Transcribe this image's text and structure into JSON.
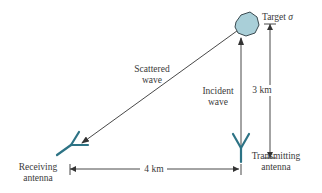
{
  "diagram": {
    "colors": {
      "line": "#333333",
      "antenna": "#2d7385",
      "target_fill": "#a9cfd8",
      "target_stroke": "#3a4a50",
      "text": "#3a3a3a"
    },
    "target": {
      "label": "Target",
      "symbol": "σ"
    },
    "scattered_wave": {
      "line1": "Scattered",
      "line2": "wave"
    },
    "incident_wave": {
      "line1": "Incident",
      "line2": "wave"
    },
    "vertical_distance": "3 km",
    "horizontal_distance": "4 km",
    "receiving_antenna": {
      "line1": "Receiving",
      "line2": "antenna"
    },
    "transmitting_antenna": {
      "line1": "Transmitting",
      "line2": "antenna"
    }
  }
}
